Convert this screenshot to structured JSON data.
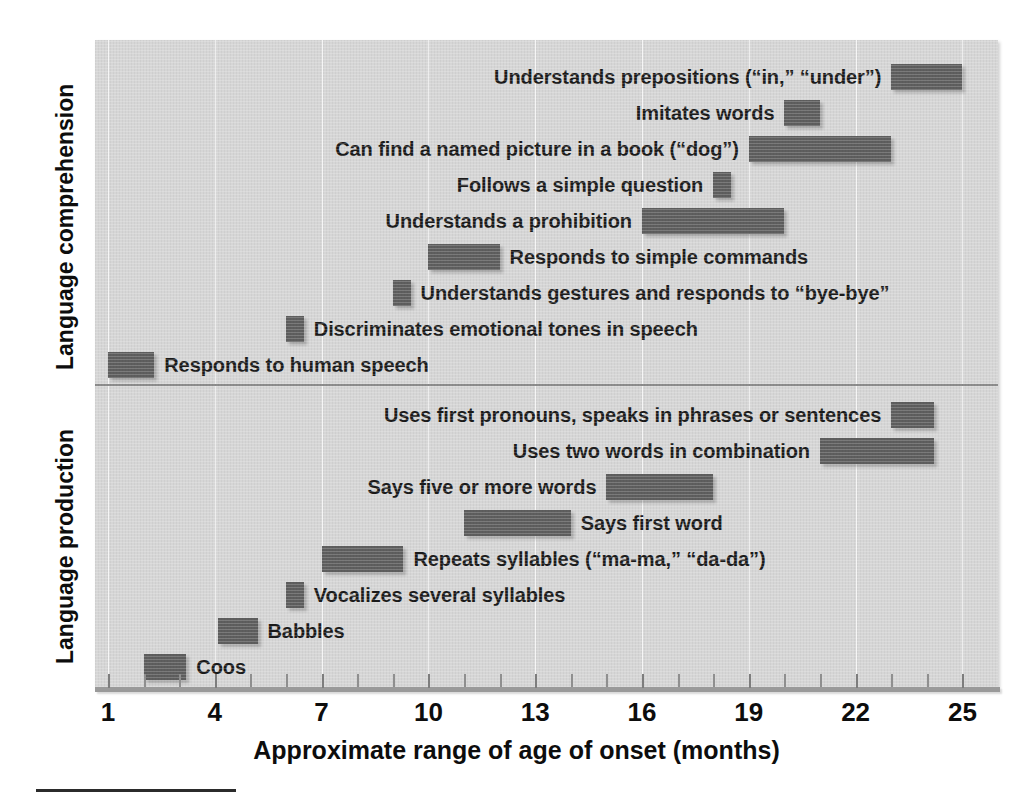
{
  "chart_data": {
    "type": "bar",
    "orientation": "horizontal",
    "subtype": "range-bar (floating bar / Gantt style)",
    "title": "",
    "xlabel": "Approximate range of age of onset (months)",
    "ylabel": "",
    "xlim": [
      0,
      26
    ],
    "xticks": [
      1,
      4,
      7,
      10,
      13,
      16,
      19,
      22,
      25
    ],
    "xtick_labels": [
      "1",
      "4",
      "7",
      "10",
      "13",
      "16",
      "19",
      "22",
      "25"
    ],
    "minor_tick_interval": 1,
    "grid": "vertical gridlines at labeled ticks",
    "legend": "none",
    "units": "months",
    "panels": [
      {
        "name": "Language comprehension",
        "label": "Language comprehension",
        "categories": [
          "Understands prepositions (“in,” “under”)",
          "Imitates words",
          "Can find a named picture in a book (“dog”)",
          "Follows a simple question",
          "Understands a prohibition",
          "Responds to simple commands",
          "Understands gestures and responds to “bye-bye”",
          "Discriminates emotional tones in speech",
          "Responds to human speech"
        ],
        "ranges": [
          [
            23,
            25
          ],
          [
            20,
            21
          ],
          [
            19,
            23
          ],
          [
            18,
            18.5
          ],
          [
            16,
            20
          ],
          [
            10,
            12
          ],
          [
            9,
            9.5
          ],
          [
            6,
            6.5
          ],
          [
            1,
            2.3
          ]
        ],
        "label_sides": [
          "left",
          "left",
          "left",
          "left",
          "left",
          "right",
          "right",
          "right",
          "right"
        ]
      },
      {
        "name": "Language production",
        "label": "Language production",
        "categories": [
          "Uses first pronouns, speaks in phrases or sentences",
          "Uses two words in combination",
          "Says five or more words",
          "Says first word",
          "Repeats syllables (“ma-ma,” “da-da”)",
          "Vocalizes several syllables",
          "Babbles",
          "Coos"
        ],
        "ranges": [
          [
            23,
            24.2
          ],
          [
            21,
            24.2
          ],
          [
            15,
            18
          ],
          [
            11,
            14
          ],
          [
            7,
            9.3
          ],
          [
            6,
            6.5
          ],
          [
            4.1,
            5.2
          ],
          [
            2,
            3.2
          ]
        ],
        "label_sides": [
          "left",
          "left",
          "left",
          "right",
          "right",
          "right",
          "right",
          "right"
        ]
      }
    ],
    "colors": {
      "bar": "#5e5e5e",
      "plot_background": "#d6d6d6",
      "gridline": "#ffffff",
      "axis": "#9a9a9a",
      "text": "#0d0d0d",
      "panel_divider": "#8d8d8d"
    }
  }
}
